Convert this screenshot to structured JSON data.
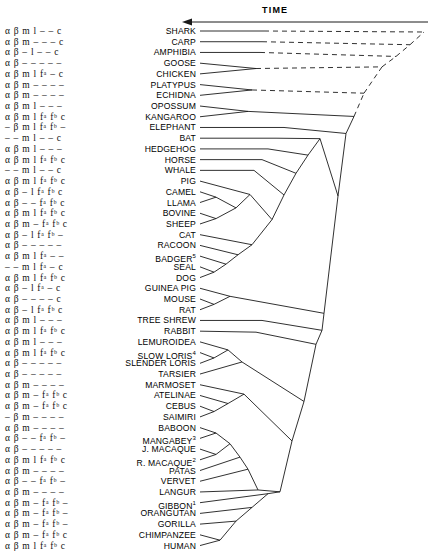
{
  "figure": {
    "title": "",
    "time_axis_label": "TIME",
    "time_axis_direction": "left",
    "line_color": "#1a1a1a",
    "text_color": "#000000",
    "background": "#ffffff"
  },
  "columns": {
    "gene_code_header": "",
    "taxon_header": ""
  },
  "rows": [
    {
      "code": "α β m l – – c",
      "taxon": "SHARK",
      "sup": ""
    },
    {
      "code": "α β m – – – c",
      "taxon": "CARP",
      "sup": ""
    },
    {
      "code": "α β – l – – c",
      "taxon": "AMPHIBIA",
      "sup": ""
    },
    {
      "code": "α β – – – – –",
      "taxon": "GOOSE",
      "sup": ""
    },
    {
      "code": "α β m l fᵃ – c",
      "taxon": "CHICKEN",
      "sup": ""
    },
    {
      "code": "α β m – – – –",
      "taxon": "PLATYPUS",
      "sup": ""
    },
    {
      "code": "α β m – – – –",
      "taxon": "ECHIDNA",
      "sup": ""
    },
    {
      "code": "α β m l – – –",
      "taxon": "OPOSSUM",
      "sup": ""
    },
    {
      "code": "α β m l fᵃ fᵇ c",
      "taxon": "KANGAROO",
      "sup": ""
    },
    {
      "code": "– β m l fᵃ fᵇ –",
      "taxon": "ELEPHANT",
      "sup": ""
    },
    {
      "code": "– – m l – – c",
      "taxon": "BAT",
      "sup": ""
    },
    {
      "code": "α β m l – – –",
      "taxon": "HEDGEHOG",
      "sup": ""
    },
    {
      "code": "α β m l fᵃ fᵇ c",
      "taxon": "HORSE",
      "sup": ""
    },
    {
      "code": "– – m l – – c",
      "taxon": "WHALE",
      "sup": ""
    },
    {
      "code": "α β m l fᵃ fᵇ c",
      "taxon": "PIG",
      "sup": ""
    },
    {
      "code": "α β – l fᵃ fᵇ c",
      "taxon": "CAMEL",
      "sup": ""
    },
    {
      "code": "α β – – fᵃ fᵇ c",
      "taxon": "LLAMA",
      "sup": ""
    },
    {
      "code": "α β m l fᵃ fᵇ c",
      "taxon": "BOVINE",
      "sup": ""
    },
    {
      "code": "α β m – fᵃ fᵇ c",
      "taxon": "SHEEP",
      "sup": ""
    },
    {
      "code": "α β – l fᵃ fᵇ –",
      "taxon": "CAT",
      "sup": ""
    },
    {
      "code": "α β – – – – –",
      "taxon": "RACOON",
      "sup": ""
    },
    {
      "code": "α β m l fᵃ – –",
      "taxon": "BADGER",
      "sup": "5"
    },
    {
      "code": "– – m l fᵃ – c",
      "taxon": "SEAL",
      "sup": ""
    },
    {
      "code": "α β m l fᵃ fᵇ c",
      "taxon": "DOG",
      "sup": ""
    },
    {
      "code": "α β – l fᵃ – c",
      "taxon": "GUINEA PIG",
      "sup": ""
    },
    {
      "code": "α β – – – – c",
      "taxon": "MOUSE",
      "sup": ""
    },
    {
      "code": "α β – l fᵃ fᵇ c",
      "taxon": "RAT",
      "sup": ""
    },
    {
      "code": "α β m l – – –",
      "taxon": "TREE SHREW",
      "sup": ""
    },
    {
      "code": "α β m l fᵃ fᵇ c",
      "taxon": "RABBIT",
      "sup": ""
    },
    {
      "code": "α β m l – – –",
      "taxon": "LEMUROIDEA",
      "sup": ""
    },
    {
      "code": "α β m l fᵃ fᵇ c",
      "taxon": "SLOW LORIS",
      "sup": "4"
    },
    {
      "code": "α β – – – – –",
      "taxon": "SLENDER LORIS",
      "sup": ""
    },
    {
      "code": "α β – – – – –",
      "taxon": "TARSIER",
      "sup": ""
    },
    {
      "code": "α β m – – – –",
      "taxon": "MARMOSET",
      "sup": ""
    },
    {
      "code": "α β m – fᵃ fᵇ c",
      "taxon": "ATELINAE",
      "sup": ""
    },
    {
      "code": "α β m – fᵃ fᵇ c",
      "taxon": "CEBUS",
      "sup": ""
    },
    {
      "code": "– β m – – – –",
      "taxon": "SAIMIRI",
      "sup": ""
    },
    {
      "code": "α β m – – – –",
      "taxon": "BABOON",
      "sup": ""
    },
    {
      "code": "α β – – fᵃ fᵇ –",
      "taxon": "MANGABEY",
      "sup": "3"
    },
    {
      "code": "α β – – – – –",
      "taxon": "J. MACAQUE",
      "sup": ""
    },
    {
      "code": "α β m l fᵃ fᵇ c",
      "taxon": "R. MACAQUE",
      "sup": "2"
    },
    {
      "code": "α β m – – – –",
      "taxon": "PATAS",
      "sup": ""
    },
    {
      "code": "α β – – fᵃ fᵇ –",
      "taxon": "VERVET",
      "sup": ""
    },
    {
      "code": "α β m – – – –",
      "taxon": "LANGUR",
      "sup": ""
    },
    {
      "code": "α β m – fᵃ fᵇ –",
      "taxon": "GIBBON",
      "sup": "1"
    },
    {
      "code": "α β m – fᵃ fᵇ –",
      "taxon": "ORANGUTAN",
      "sup": ""
    },
    {
      "code": "α β m – fᵃ fᵇ –",
      "taxon": "GORILLA",
      "sup": ""
    },
    {
      "code": "α β m – fᵃ fᵇ c",
      "taxon": "CHIMPANZEE",
      "sup": ""
    },
    {
      "code": "α β m l fᵃ fᵇ c",
      "taxon": "HUMAN",
      "sup": ""
    }
  ],
  "chart_data": {
    "type": "tree",
    "title": "",
    "xlabel": "TIME",
    "ylabel": "",
    "leaf_order": [
      "SHARK",
      "CARP",
      "AMPHIBIA",
      "GOOSE",
      "CHICKEN",
      "PLATYPUS",
      "ECHIDNA",
      "OPOSSUM",
      "KANGAROO",
      "ELEPHANT",
      "BAT",
      "HEDGEHOG",
      "HORSE",
      "WHALE",
      "PIG",
      "CAMEL",
      "LLAMA",
      "BOVINE",
      "SHEEP",
      "CAT",
      "RACOON",
      "BADGER",
      "SEAL",
      "DOG",
      "GUINEA PIG",
      "MOUSE",
      "RAT",
      "TREE SHREW",
      "RABBIT",
      "LEMUROIDEA",
      "SLOW LORIS",
      "SLENDER LORIS",
      "TARSIER",
      "MARMOSET",
      "ATELINAE",
      "CEBUS",
      "SAIMIRI",
      "BABOON",
      "MANGABEY",
      "J. MACAQUE",
      "R. MACAQUE",
      "PATAS",
      "VERVET",
      "LANGUR",
      "GIBBON",
      "ORANGUTAN",
      "GORILLA",
      "CHIMPANZEE",
      "HUMAN"
    ],
    "gene_symbols": [
      "α",
      "β",
      "m",
      "l",
      "fᵃ",
      "fᵇ",
      "c"
    ]
  }
}
